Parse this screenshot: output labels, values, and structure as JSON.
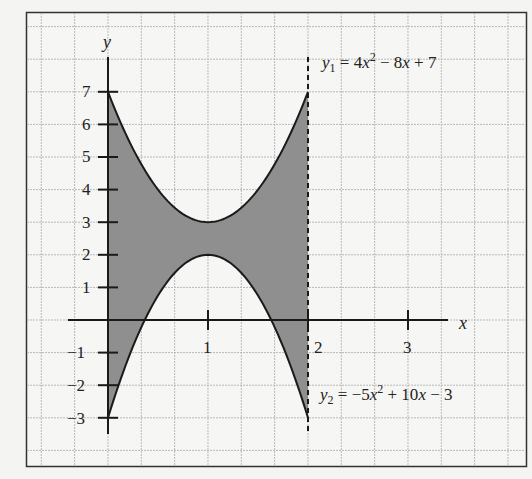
{
  "chart_data": {
    "type": "area",
    "title": "",
    "xlabel": "x",
    "ylabel": "y",
    "xlim": [
      -0.8,
      4.2
    ],
    "ylim": [
      -4.4,
      9.5
    ],
    "grid": true,
    "x_ticks": [
      1,
      2,
      3
    ],
    "x_tick_labels": [
      "1",
      "2",
      "3"
    ],
    "y_ticks": [
      -3,
      -2,
      -1,
      1,
      2,
      3,
      4,
      5,
      6,
      7
    ],
    "y_tick_labels": [
      "−3",
      "−2",
      "−1",
      "1",
      "2",
      "3",
      "4",
      "5",
      "6",
      "7"
    ],
    "series": [
      {
        "name": "y1",
        "equation": "y1 = 4x² − 8x + 7",
        "x": [
          0,
          0.25,
          0.5,
          0.75,
          1,
          1.25,
          1.5,
          1.75,
          2
        ],
        "values": [
          7,
          5.25,
          4,
          3.25,
          3,
          3.25,
          4,
          5.25,
          7
        ]
      },
      {
        "name": "y2",
        "equation": "y2 = −5x² + 10x − 3",
        "x": [
          0,
          0.25,
          0.5,
          0.75,
          1,
          1.25,
          1.5,
          1.75,
          2
        ],
        "values": [
          -3,
          -0.8125,
          0.75,
          1.6875,
          2,
          1.6875,
          0.75,
          -0.8125,
          -3
        ]
      }
    ],
    "shaded_region": {
      "between": [
        "y1",
        "y2"
      ],
      "x_from": 0,
      "x_to": 2,
      "color": "#8f8f8f"
    },
    "annotations": [
      {
        "text": "dashed vertical line at x = 2",
        "x": 2
      }
    ]
  },
  "labels": {
    "y_axis": "y",
    "x_axis": "x",
    "eq1_prefix": "y",
    "eq1_sub": "1",
    "eq1_mid": " = 4",
    "eq1_var": "x",
    "eq1_sup": "2",
    "eq1_tail1": " − 8",
    "eq1_var2": "x",
    "eq1_tail2": " + 7",
    "eq2_prefix": "y",
    "eq2_sub": "2",
    "eq2_mid": " = −5",
    "eq2_var": "x",
    "eq2_sup": "2",
    "eq2_tail1": " + 10",
    "eq2_var2": "x",
    "eq2_tail2": " − 3",
    "x_ticks": [
      "1",
      "2",
      "3"
    ],
    "y_ticks": [
      "7",
      "6",
      "5",
      "4",
      "3",
      "2",
      "1",
      "−1",
      "−2",
      "−3"
    ]
  },
  "colors": {
    "fill": "#8f8f8f",
    "line": "#1a1a1a",
    "grid": "#b9b9b9",
    "paper": "#f4f4f2"
  }
}
